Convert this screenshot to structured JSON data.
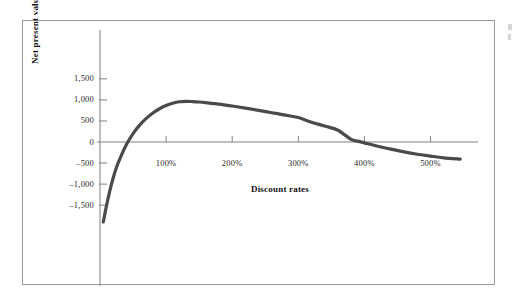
{
  "figure": {
    "frame_color": "#9a9a9a",
    "background": "#ffffff",
    "curve_color": "#4a4a4a",
    "axis_color": "#808080",
    "text_color": "#2a2a2a"
  },
  "chart_data": {
    "type": "line",
    "title": "",
    "subtitle": "",
    "xlabel": "Discount rates",
    "ylabel": "Net present value (dollars)",
    "xlim": [
      0,
      560
    ],
    "ylim": [
      -2000,
      1750
    ],
    "grid": false,
    "legend": "none",
    "x_tick_values": [
      100,
      200,
      300,
      400,
      500
    ],
    "x_tick_labels": [
      "100%",
      "200%",
      "300%",
      "400%",
      "500%"
    ],
    "y_tick_values": [
      1500,
      1000,
      500,
      0,
      -500,
      -1000,
      -1500
    ],
    "y_tick_labels": [
      "1,500",
      "1,000",
      "500",
      "0",
      "-500",
      "-1,000",
      "-1,500"
    ],
    "series": [
      {
        "name": "Net present value",
        "x": [
          5,
          10,
          15,
          20,
          25,
          30,
          40,
          50,
          60,
          70,
          80,
          90,
          100,
          110,
          120,
          130,
          140,
          150,
          160,
          180,
          200,
          220,
          240,
          260,
          280,
          300,
          320,
          340,
          360,
          380,
          390,
          400,
          420,
          440,
          460,
          480,
          500,
          520,
          545
        ],
        "y": [
          -1900,
          -1500,
          -1150,
          -850,
          -600,
          -400,
          -60,
          200,
          400,
          560,
          690,
          790,
          865,
          920,
          955,
          965,
          960,
          950,
          935,
          900,
          855,
          805,
          750,
          695,
          640,
          580,
          470,
          380,
          280,
          60,
          20,
          -20,
          -100,
          -170,
          -235,
          -290,
          -335,
          -375,
          -405
        ]
      }
    ],
    "annotations": {
      "peak_value": 965,
      "peak_discount_rate": "130%",
      "zero_crossing_rate": "390%"
    }
  },
  "page_edge_marks": {
    "count": 2
  }
}
